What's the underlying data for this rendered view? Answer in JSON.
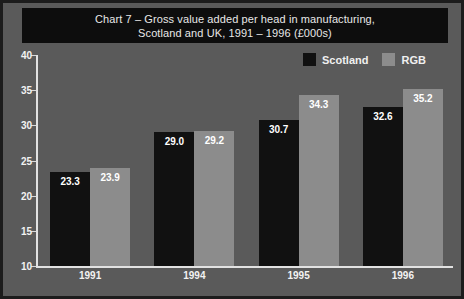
{
  "chart_data": {
    "type": "bar",
    "title_line1": "Chart 7 – Gross value added per head in manufacturing,",
    "title_line2": "Scotland and UK, 1991 – 1996 (£000s)",
    "xlabel": "",
    "ylabel": "",
    "categories": [
      "1991",
      "1994",
      "1995",
      "1996"
    ],
    "series": [
      {
        "name": "Scotland",
        "color": "#111111",
        "values": [
          23.3,
          29.0,
          30.7,
          32.6
        ],
        "labels": [
          "23.3",
          "29.0",
          "30.7",
          "32.6"
        ]
      },
      {
        "name": "RGB",
        "color": "#8c8c8c",
        "values": [
          23.9,
          29.2,
          34.3,
          35.2
        ],
        "labels": [
          "23.9",
          "29.2",
          "34.3",
          "35.2"
        ]
      }
    ],
    "ylim": [
      10,
      40
    ],
    "ytick_values": [
      10,
      15,
      20,
      25,
      30,
      35,
      40
    ],
    "ytick_labels": [
      "10",
      "15",
      "20",
      "25",
      "30",
      "35",
      "40"
    ],
    "grid": false,
    "legend_position": "top-right",
    "legend_entries": [
      "Scotland",
      "RGB"
    ]
  },
  "style": {
    "background": "#5a5a5a",
    "border_color": "#1c1c1c",
    "banner_background": "#0d0d0d",
    "text_color": "#f2f2f2",
    "axis_color": "#e2e2e2"
  }
}
